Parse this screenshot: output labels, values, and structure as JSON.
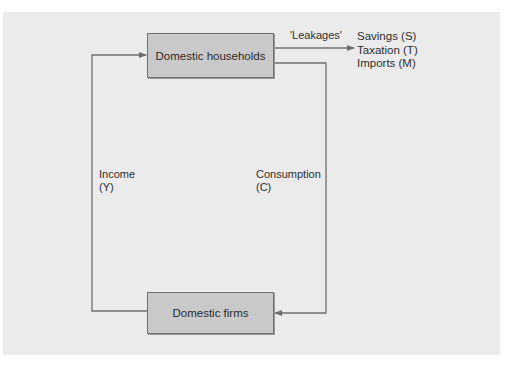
{
  "diagram": {
    "type": "circular-flow",
    "nodes": {
      "households": {
        "label": "Domestic households"
      },
      "firms": {
        "label": "Domestic firms"
      }
    },
    "flows": {
      "income": {
        "label": "Income",
        "symbol": "(Y)",
        "from": "firms",
        "to": "households"
      },
      "consumption": {
        "label": "Consumption",
        "symbol": "(C)",
        "from": "households",
        "to": "firms"
      },
      "leakages": {
        "label": "'Leakages'",
        "from": "households",
        "items": [
          "Savings (S)",
          "Taxation (T)",
          "Imports (M)"
        ]
      }
    },
    "colors": {
      "page_background": "#ffffff",
      "panel_background": "#ebebeb",
      "box_fill": "#c9c9c9",
      "box_border": "#707070",
      "line_color": "#6e6e6e",
      "text_color": "#2e2e2e"
    }
  }
}
